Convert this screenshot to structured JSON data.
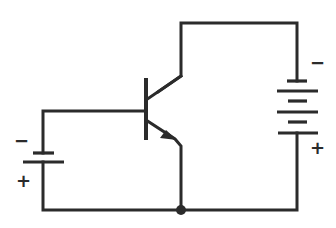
{
  "diagram": {
    "type": "circuit-schematic",
    "components": [
      {
        "id": "Q1",
        "kind": "npn-transistor",
        "terminals": [
          "base",
          "collector",
          "emitter"
        ]
      },
      {
        "id": "B1",
        "kind": "battery",
        "cells": 1,
        "role": "base-bias"
      },
      {
        "id": "B2",
        "kind": "battery",
        "cells": 3,
        "role": "collector-supply"
      }
    ],
    "labels": {
      "base_battery_negative": "−",
      "base_battery_positive": "+",
      "collector_battery_negative": "−",
      "collector_battery_positive": "+"
    },
    "junctions": [
      {
        "name": "common-node",
        "x": 181,
        "y": 210
      }
    ],
    "colors": {
      "line": "#2b2b2b",
      "background": "#ffffff"
    }
  }
}
